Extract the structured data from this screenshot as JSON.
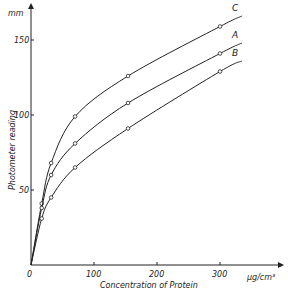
{
  "chart_data": {
    "type": "line",
    "title": "",
    "xlabel": "Concentration  of  Protein",
    "xunit": "µg/cm³",
    "ylabel": "Photometer    reading",
    "yunit": "mm",
    "xlim": [
      0,
      340
    ],
    "ylim": [
      0,
      170
    ],
    "xticks": [
      0,
      100,
      200,
      300
    ],
    "xtick_labels": [
      "0",
      "100",
      "200",
      "300"
    ],
    "yticks": [
      50,
      100,
      150
    ],
    "ytick_labels": [
      "50",
      "100",
      "150"
    ],
    "grid": false,
    "legend": "inline curve labels",
    "series": [
      {
        "name": "C",
        "x": [
          0,
          17,
          32,
          70,
          154,
          300
        ],
        "values": [
          0,
          41,
          68,
          99,
          126,
          159
        ],
        "curve_end": [
          335,
          166
        ]
      },
      {
        "name": "A",
        "x": [
          0,
          17,
          32,
          70,
          154,
          300
        ],
        "values": [
          0,
          38,
          60,
          81,
          108,
          141
        ],
        "curve_end": [
          335,
          148
        ]
      },
      {
        "name": "B",
        "x": [
          0,
          17,
          32,
          70,
          154,
          300
        ],
        "values": [
          0,
          31,
          45,
          65,
          91,
          129
        ],
        "curve_end": [
          335,
          136
        ]
      }
    ]
  }
}
